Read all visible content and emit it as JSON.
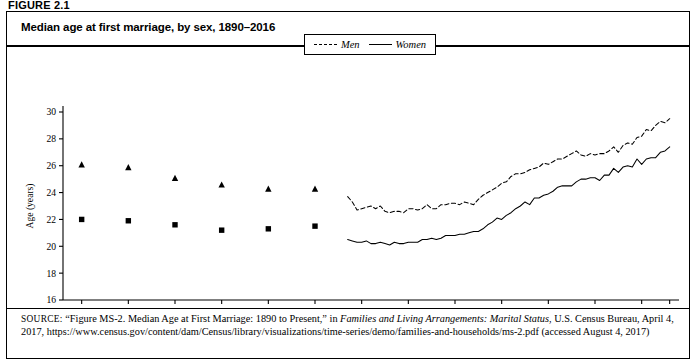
{
  "figure_label": "FIGURE 2.1",
  "title": "Median age at first marriage, by sex, 1890–2016",
  "legend": {
    "position": "top-center",
    "men": "Men",
    "women": "Women"
  },
  "axis": {
    "y_label": "Age (years)",
    "y_ticks": [
      16,
      18,
      20,
      22,
      24,
      26,
      28,
      30
    ],
    "x_ticks": [
      1890,
      1900,
      1910,
      1920,
      1930,
      1940,
      1950,
      1960,
      1970,
      1980,
      1990,
      2000,
      2010,
      2016
    ]
  },
  "source": {
    "prefix": "SOURCE:",
    "part1": " “Figure MS-2. Median Age at First Marriage: 1890 to Present,” in ",
    "italic": "Families and Living Arrangements: Marital Status",
    "part2": ", U.S. Census Bureau, April 4, 2017, https://www.census.gov/content/dam/Census/library/visualizations/time-series/demo/families-and-households/ms-2.pdf (accessed August 4, 2017)"
  },
  "chart_data": {
    "type": "line",
    "title": "Median age at first marriage, by sex, 1890–2016",
    "xlabel": "",
    "ylabel": "Age (years)",
    "xlim": [
      1886,
      2018
    ],
    "ylim": [
      16,
      30
    ],
    "grid": false,
    "legend_position": "top-center",
    "marker_series": [
      {
        "name": "Men",
        "marker": "triangle",
        "x": [
          1890,
          1900,
          1910,
          1920,
          1930,
          1940
        ],
        "y": [
          26.1,
          25.9,
          25.1,
          24.6,
          24.3,
          24.3
        ]
      },
      {
        "name": "Women",
        "marker": "square",
        "x": [
          1890,
          1900,
          1910,
          1920,
          1930,
          1940
        ],
        "y": [
          22.0,
          21.9,
          21.6,
          21.2,
          21.3,
          21.5
        ]
      }
    ],
    "series": [
      {
        "name": "Men",
        "style": "dashed",
        "x": [
          1947,
          1948,
          1949,
          1950,
          1951,
          1952,
          1953,
          1954,
          1955,
          1956,
          1957,
          1958,
          1959,
          1960,
          1961,
          1962,
          1963,
          1964,
          1965,
          1966,
          1967,
          1968,
          1969,
          1970,
          1971,
          1972,
          1973,
          1974,
          1975,
          1976,
          1977,
          1978,
          1979,
          1980,
          1981,
          1982,
          1983,
          1984,
          1985,
          1986,
          1987,
          1988,
          1989,
          1990,
          1991,
          1992,
          1993,
          1994,
          1995,
          1996,
          1997,
          1998,
          1999,
          2000,
          2001,
          2002,
          2003,
          2004,
          2005,
          2006,
          2007,
          2008,
          2009,
          2010,
          2011,
          2012,
          2013,
          2014,
          2015,
          2016
        ],
        "y": [
          23.7,
          23.3,
          22.7,
          22.8,
          22.9,
          23.0,
          22.8,
          23.0,
          22.6,
          22.5,
          22.6,
          22.6,
          22.5,
          22.8,
          22.8,
          22.7,
          22.8,
          23.1,
          22.8,
          22.8,
          23.1,
          23.1,
          23.2,
          23.2,
          23.1,
          23.3,
          23.2,
          23.1,
          23.5,
          23.8,
          24.0,
          24.2,
          24.4,
          24.7,
          24.8,
          25.2,
          25.4,
          25.4,
          25.5,
          25.7,
          25.8,
          25.9,
          26.2,
          26.1,
          26.3,
          26.5,
          26.5,
          26.7,
          26.9,
          27.1,
          26.8,
          26.7,
          26.9,
          26.8,
          26.9,
          26.9,
          27.1,
          27.4,
          27.0,
          27.5,
          27.7,
          27.6,
          28.1,
          28.2,
          28.7,
          28.6,
          29.0,
          29.3,
          29.2,
          29.5
        ]
      },
      {
        "name": "Women",
        "style": "solid",
        "x": [
          1947,
          1948,
          1949,
          1950,
          1951,
          1952,
          1953,
          1954,
          1955,
          1956,
          1957,
          1958,
          1959,
          1960,
          1961,
          1962,
          1963,
          1964,
          1965,
          1966,
          1967,
          1968,
          1969,
          1970,
          1971,
          1972,
          1973,
          1974,
          1975,
          1976,
          1977,
          1978,
          1979,
          1980,
          1981,
          1982,
          1983,
          1984,
          1985,
          1986,
          1987,
          1988,
          1989,
          1990,
          1991,
          1992,
          1993,
          1994,
          1995,
          1996,
          1997,
          1998,
          1999,
          2000,
          2001,
          2002,
          2003,
          2004,
          2005,
          2006,
          2007,
          2008,
          2009,
          2010,
          2011,
          2012,
          2013,
          2014,
          2015,
          2016
        ],
        "y": [
          20.5,
          20.4,
          20.3,
          20.3,
          20.4,
          20.2,
          20.2,
          20.3,
          20.2,
          20.1,
          20.3,
          20.2,
          20.2,
          20.3,
          20.3,
          20.3,
          20.5,
          20.5,
          20.6,
          20.5,
          20.6,
          20.8,
          20.8,
          20.8,
          20.9,
          20.9,
          21.0,
          21.1,
          21.1,
          21.3,
          21.6,
          21.8,
          22.1,
          22.0,
          22.3,
          22.5,
          22.8,
          23.0,
          23.3,
          23.1,
          23.6,
          23.6,
          23.8,
          23.9,
          24.1,
          24.4,
          24.5,
          24.5,
          24.5,
          24.8,
          25.0,
          25.0,
          25.1,
          25.1,
          24.9,
          25.3,
          25.3,
          25.8,
          25.5,
          25.9,
          26.0,
          25.9,
          26.5,
          26.1,
          26.5,
          26.6,
          26.6,
          27.0,
          27.1,
          27.4
        ]
      }
    ]
  }
}
